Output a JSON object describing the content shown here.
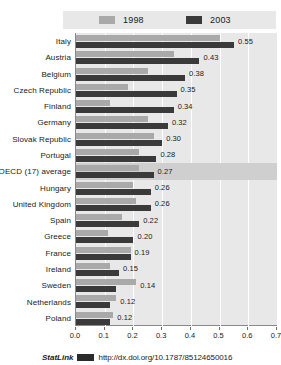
{
  "chart_data": {
    "type": "bar",
    "orientation": "horizontal",
    "title": "",
    "xlabel": "",
    "ylabel": "",
    "xlim": [
      0.0,
      0.7
    ],
    "xticks": [
      "0.0",
      "0.1",
      "0.2",
      "0.3",
      "0.4",
      "0.5",
      "0.6",
      "0.7"
    ],
    "grid": true,
    "legend_position": "top",
    "categories": [
      "Italy",
      "Austria",
      "Belgium",
      "Czech Republic",
      "Finland",
      "Germany",
      "Slovak Republic",
      "Portugal",
      "OECD (17) average",
      "Hungary",
      "United Kingdom",
      "Spain",
      "Greece",
      "France",
      "Ireland",
      "Sweden",
      "Netherlands",
      "Poland"
    ],
    "series": [
      {
        "name": "1998",
        "color": "#a9a9a9",
        "values": [
          0.5,
          0.34,
          0.25,
          0.18,
          0.12,
          0.25,
          0.27,
          0.22,
          0.22,
          0.2,
          0.21,
          0.16,
          0.11,
          0.19,
          0.12,
          0.21,
          0.14,
          0.13
        ]
      },
      {
        "name": "2003",
        "color": "#3a3a3a",
        "values": [
          0.55,
          0.43,
          0.38,
          0.35,
          0.34,
          0.32,
          0.3,
          0.28,
          0.27,
          0.26,
          0.26,
          0.22,
          0.2,
          0.19,
          0.15,
          0.14,
          0.12,
          0.12
        ]
      }
    ],
    "value_labels": [
      "0.55",
      "0.43",
      "0.38",
      "0.35",
      "0.34",
      "0.32",
      "0.30",
      "0.28",
      "0.27",
      "0.26",
      "0.26",
      "0.22",
      "0.20",
      "0.19",
      "0.15",
      "0.14",
      "0.12",
      "0.12"
    ],
    "highlight_category": "OECD (17) average"
  },
  "legend": {
    "items": [
      {
        "label": "1998",
        "icon": "legend-swatch-1998"
      },
      {
        "label": "2003",
        "icon": "legend-swatch-2003"
      }
    ]
  },
  "footer": {
    "statlink_label": "StatLink",
    "doi_url": "http://dx.doi.org/10.1787/85124650016"
  },
  "colors": {
    "series_1998": "#a9a9a9",
    "series_2003": "#3a3a3a",
    "plot_background": "#e8e8e8",
    "highlight_band": "#cfcfcf",
    "gridline": "#ffffff"
  }
}
